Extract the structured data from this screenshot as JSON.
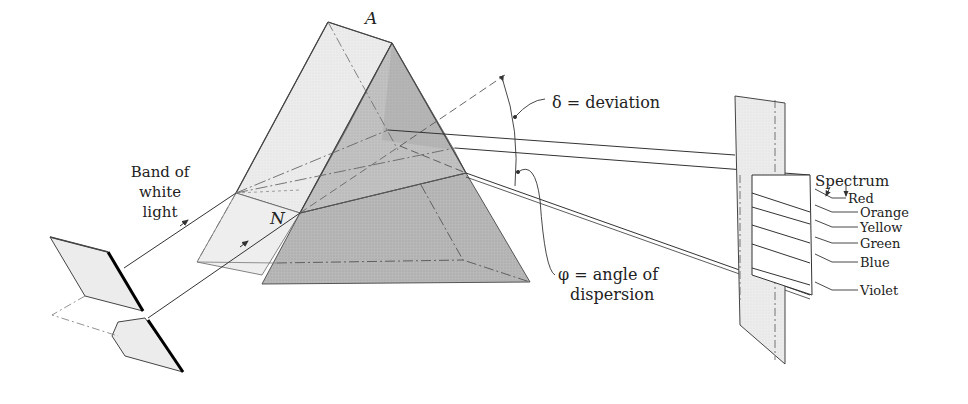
{
  "diagram": {
    "labels": {
      "apex": "A",
      "normal_point": "N",
      "incident": [
        "Band of",
        "white",
        "light"
      ],
      "deviation": "δ = deviation",
      "dispersion": [
        "φ = angle of",
        "dispersion"
      ],
      "spectrum_title": "Spectrum"
    },
    "spectrum_colors": [
      "Red",
      "Orange",
      "Yellow",
      "Green",
      "Blue",
      "Violet"
    ],
    "colors": {
      "ink": "#333333",
      "light_face": "#e8e8e8",
      "dark_face": "#b4b4b4",
      "screen": "#ececec",
      "background": "#ffffff"
    }
  }
}
